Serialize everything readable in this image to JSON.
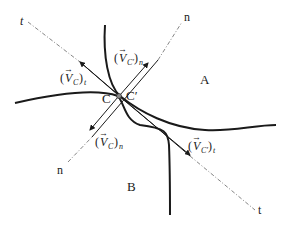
{
  "diagram": {
    "regions": {
      "A": "A",
      "B": "B"
    },
    "points": {
      "C": "C",
      "C_prime": "C′"
    },
    "axes": {
      "t_upper": "t",
      "t_lower": "t",
      "n_upper": "n",
      "n_lower": "n"
    },
    "vectors": {
      "vc_t": {
        "base": "V",
        "sub": "C",
        "comp": "t"
      },
      "vcp_n": {
        "base": "V",
        "sub": "C′",
        "comp": "n"
      },
      "vc_n": {
        "base": "V",
        "sub": "C",
        "comp": "n"
      },
      "vcp_t": {
        "base": "V",
        "sub": "C′",
        "comp": "t"
      }
    },
    "colors": {
      "curve": "#1a1a1a",
      "axis": "#555555"
    }
  }
}
